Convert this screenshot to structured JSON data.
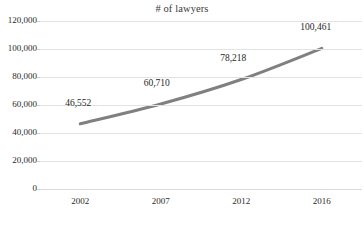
{
  "chart_data": {
    "type": "line",
    "title": "# of lawyers",
    "xlabel": "",
    "ylabel": "",
    "categories": [
      "2002",
      "2007",
      "2012",
      "2016"
    ],
    "values": [
      46552,
      60710,
      78218,
      100461
    ],
    "point_labels": [
      "46,552",
      "60,710",
      "78,218",
      "100,461"
    ],
    "series": [
      {
        "name": "# of lawyers",
        "values": [
          46552,
          60710,
          78218,
          100461
        ],
        "color": "#808080"
      }
    ],
    "ylim": [
      0,
      120000
    ],
    "yticks": [
      0,
      20000,
      40000,
      60000,
      80000,
      100000,
      120000
    ],
    "ytick_labels": [
      "0",
      "20,000",
      "40,000",
      "60,000",
      "80,000",
      "100,000",
      "120,000"
    ],
    "grid": true,
    "grid_axis": "y",
    "legend": false,
    "legend_position": "none",
    "smooth": true,
    "markers": false,
    "line_color": "#808080",
    "line_width": 3,
    "grid_color": "#e2e2e2",
    "background_color": "#ffffff",
    "text_color": "#1f1f1f"
  }
}
